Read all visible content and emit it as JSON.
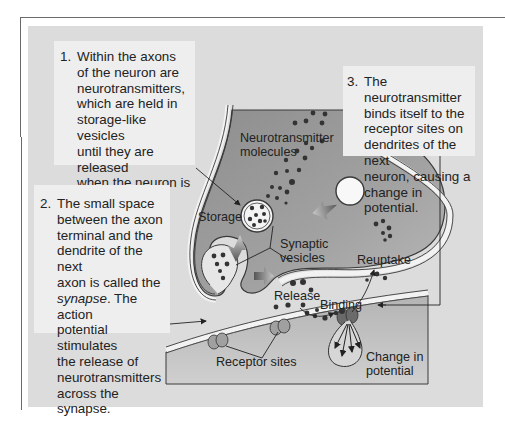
{
  "callouts": {
    "step1": {
      "number": "1.",
      "lines": [
        "Within the axons",
        "of the neuron are",
        "neurotransmitters,",
        "which are held in",
        "storage-like vesicles",
        "until they are released",
        "when the neuron is",
        "stimulated."
      ]
    },
    "step2": {
      "number": "2.",
      "lines_before": [
        "The small space",
        "between the axon",
        "terminal and the",
        "dendrite of the next",
        "axon is called the"
      ],
      "italic_word": "synapse",
      "after_italic": ". The action",
      "lines_after": [
        "potential stimulates",
        "the release of",
        "neurotransmitters",
        "across the synapse."
      ]
    },
    "step3": {
      "number": "3.",
      "lines": [
        "The neurotransmitter",
        "binds itself to the",
        "receptor sites on",
        "dendrites of the next",
        "neuron, causing a",
        "change in potential."
      ]
    }
  },
  "labels": {
    "neurotransmitter_molecules_1": "Neurotransmitter",
    "neurotransmitter_molecules_2": "molecules",
    "storage": "Storage",
    "synaptic_vesicles_1": "Synaptic",
    "synaptic_vesicles_2": "vesicles",
    "reuptake": "Reuptake",
    "release": "Release",
    "binding": "Binding",
    "receptor_sites": "Receptor sites",
    "change_in_potential_1": "Change in",
    "change_in_potential_2": "potential"
  },
  "colors": {
    "panel": "#dcdcdc",
    "callout": "#eeeeee",
    "terminal_fill": "#9a9a9a",
    "membrane": "#f2f2f2",
    "dot": "#333333",
    "outline": "#3a3a3a"
  }
}
